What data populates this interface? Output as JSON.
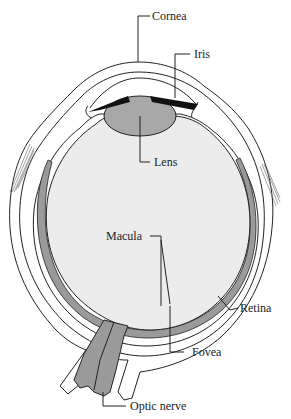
{
  "diagram": {
    "labels": {
      "cornea": "Cornea",
      "iris": "Iris",
      "lens": "Lens",
      "macula": "Macula",
      "retina": "Retina",
      "fovea": "Fovea",
      "optic_nerve": "Optic nerve"
    },
    "colors": {
      "background": "#ffffff",
      "outline": "#222222",
      "vitreous": "#ececec",
      "lens": "#a8a8a8",
      "retina": "#9a9a9a",
      "optic_nerve": "#9a9a9a",
      "iris": "#111111",
      "sclera": "#ffffff"
    }
  }
}
